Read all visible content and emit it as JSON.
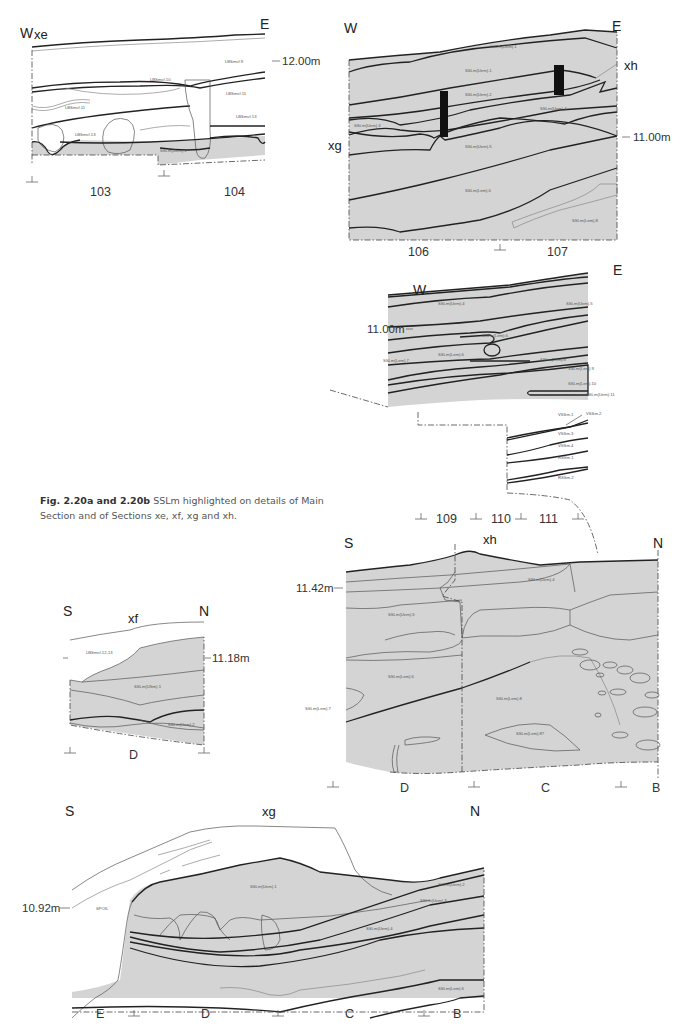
{
  "figure": {
    "caption_bold": "Fig. 2.20a and 2.20b",
    "caption_text": " SSLm highlighted on details of Main Section and of Sections xe, xf, xg and xh."
  },
  "panels": {
    "xe": {
      "section_label": "xe",
      "west": "W",
      "east": "E",
      "elevation": "12.00m",
      "grid_labels": [
        "103",
        "104"
      ],
      "context_labels": [
        "LBSmcf.9",
        "LBSmcf.10",
        "LBSmcf.11",
        "LBSmcf.11",
        "LBSmcf.13",
        "LBSmcf.13",
        "SSLm(Uem).1"
      ]
    },
    "main_upper": {
      "west": "W",
      "east": "E",
      "section_marker_right": "xh",
      "section_marker_left": "xg",
      "elevation": "11.00m",
      "grid_labels": [
        "106",
        "107"
      ],
      "context_labels": [
        "SSLm(Uem).1",
        "SSLm(Uem).1",
        "SSLm(Uem).2",
        "SSLm(Uem).3",
        "SSLm(Uem).4",
        "SSLm(Uem).5",
        "SSLm(Lem).6",
        "SSLm(Lem).8"
      ]
    },
    "main_lower": {
      "west": "W",
      "east": "E",
      "elevation": "11.00m",
      "grid_labels": [
        "109",
        "110",
        "111"
      ],
      "context_labels": [
        "SSLm(Uem).4",
        "SSLm(Uem).5",
        "SSLm(Lem).6",
        "SSLm(Lem).6",
        "SSLm(Lem).7",
        "SSLm(Lem).8",
        "SSLm(Lem).9",
        "SSLm(Lem).10",
        "SSLm(Uem).11",
        "VSSm.1",
        "VSSm.2",
        "VSSm.3",
        "VSSm.4",
        "RSSm.1",
        "RSSm.2"
      ]
    },
    "xf": {
      "section_label": "xf",
      "south": "S",
      "north": "N",
      "elevation": "11.18m",
      "grid_labels": [
        "D"
      ],
      "context_labels": [
        "LBSmcf.12-13",
        "SSLm(USm).1",
        "SSLm(Uem).2"
      ]
    },
    "xh": {
      "section_label": "xh",
      "south": "S",
      "north": "N",
      "elevation": "11.42m",
      "grid_labels": [
        "D",
        "C",
        "B"
      ],
      "context_labels": [
        "SSLm(Uem).4",
        "SSLm(Uem).5",
        "SSLm(Lem).6",
        "SSLm(Lem).7",
        "SSLm(Lem).8",
        "SSLm(Lem).8?"
      ]
    },
    "xg": {
      "section_label": "xg",
      "south": "S",
      "north": "N",
      "elevation": "10.92m",
      "grid_labels": [
        "E",
        "D",
        "C",
        "B"
      ],
      "context_labels": [
        "SPOIL",
        "SSLm(Uem).1",
        "SSLm(Uem).2",
        "SSLm(Uem).3",
        "SSLm(Uem).4",
        "SSLm(Lem).6"
      ]
    }
  },
  "colors": {
    "sslm_fill": "#d4d4d4",
    "line": "#222222",
    "background": "#ffffff"
  }
}
